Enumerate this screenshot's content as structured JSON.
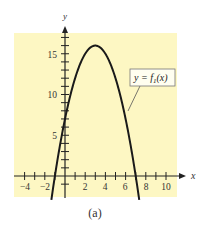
{
  "chart_data": {
    "type": "line",
    "title": "",
    "caption": "(a)",
    "xlabel": "x",
    "ylabel": "y",
    "xlim": [
      -5,
      11.5
    ],
    "ylim": [
      -2,
      17.5
    ],
    "grid": false,
    "background_color": "#fdf7c3",
    "x_ticks": [
      -4,
      -3,
      -2,
      -1,
      1,
      2,
      3,
      4,
      5,
      6,
      7,
      8,
      9,
      10
    ],
    "x_tick_labels": [
      "-4",
      "-2",
      "2",
      "4",
      "6",
      "8",
      "10"
    ],
    "x_tick_label_values": [
      -4,
      -2,
      2,
      4,
      6,
      8,
      10
    ],
    "y_ticks": [
      -1,
      1,
      2,
      3,
      4,
      5,
      6,
      7,
      8,
      9,
      10,
      11,
      12,
      13,
      14,
      15,
      16,
      17
    ],
    "y_tick_labels": [
      "5",
      "10",
      "15"
    ],
    "y_tick_label_values": [
      5,
      10,
      15
    ],
    "series": [
      {
        "name": "y = f1(x)",
        "expression": "-x^2 + 6x + 7",
        "color": "#1a1a1a",
        "x": [
          -1.3,
          -1,
          0,
          1,
          2,
          3,
          4,
          5,
          6,
          7,
          7.3
        ],
        "y": [
          -2.49,
          0,
          7,
          12,
          15,
          16,
          15,
          12,
          7,
          0,
          -2.49
        ]
      }
    ],
    "annotations": [
      {
        "text": "y = f₁(x)",
        "points_to": [
          6.1,
          6.5
        ]
      }
    ]
  },
  "labels": {
    "x_axis": "x",
    "y_axis": "y",
    "legend": "y = f",
    "legend_sub": "1",
    "legend_tail": "(x)",
    "caption": "(a)",
    "xt_m4": "−4",
    "xt_m2": "−2",
    "xt_2": "2",
    "xt_4": "4",
    "xt_6": "6",
    "xt_8": "8",
    "xt_10": "10",
    "yt_5": "5",
    "yt_10": "10",
    "yt_15": "15"
  }
}
